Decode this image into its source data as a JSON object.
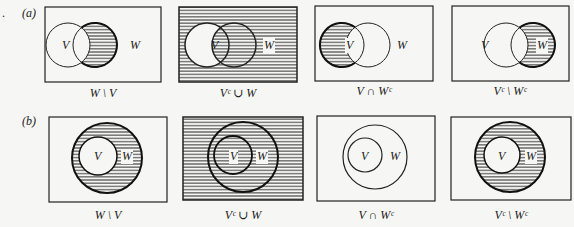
{
  "margin_mark": ".",
  "rows": [
    {
      "label": "(a)",
      "kind": "overlapping",
      "diagrams": [
        {
          "caption": "W \\ V",
          "shaded": "W minus V",
          "sets": [
            "V",
            "W"
          ]
        },
        {
          "caption": "Vᶜ ∪ W",
          "shaded": "complement of V union W",
          "sets": [
            "V",
            "W"
          ]
        },
        {
          "caption": "V ∩ Wᶜ",
          "shaded": "V minus W",
          "sets": [
            "V",
            "W"
          ]
        },
        {
          "caption": "Vᶜ \\ Wᶜ",
          "shaded": "W minus V",
          "sets": [
            "V",
            "W"
          ]
        }
      ]
    },
    {
      "label": "(b)",
      "kind": "nested (V subset of W)",
      "diagrams": [
        {
          "caption": "W \\ V",
          "shaded": "W minus V (annulus)",
          "sets": [
            "V",
            "W"
          ]
        },
        {
          "caption": "Vᶜ ∪ W",
          "shaded": "entire universe",
          "sets": [
            "V",
            "W"
          ]
        },
        {
          "caption": "V ∩ Wᶜ",
          "shaded": "empty",
          "sets": [
            "V",
            "W"
          ]
        },
        {
          "caption": "Vᶜ \\ Wᶜ",
          "shaded": "W minus V (annulus)",
          "sets": [
            "V",
            "W"
          ]
        }
      ]
    }
  ],
  "set_labels": {
    "v": "V",
    "w": "W"
  }
}
